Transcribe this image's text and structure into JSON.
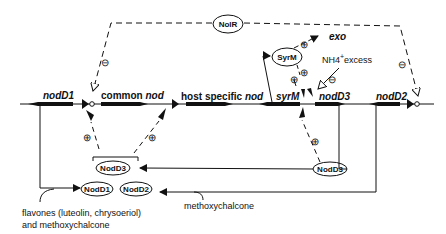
{
  "diagram": {
    "genes": {
      "nodD1": "nodD1",
      "common_prefix": "common ",
      "common_suffix": "nod",
      "host_prefix": "host specific ",
      "host_suffix": "nod",
      "syrM": "syrM",
      "nodD3": "nodD3",
      "nodD2": "nodD2",
      "exo": "exo"
    },
    "proteins": {
      "NolR": "NolR",
      "SyrM": "SyrM",
      "NodD3": "NodD3",
      "NodD1": "NodD1",
      "NodD2": "NodD2"
    },
    "signals": {
      "nh4_base": "NH4",
      "nh4_sup": "+",
      "nh4_suffix": "excess",
      "flavones_line1": "flavones (luteolin, chrysoeriol)",
      "flavones_line2": "and methoxychalcone",
      "methoxychalcone": "methoxychalcone"
    },
    "regulation_marks": {
      "positive": "⊕",
      "negative": "⊖"
    },
    "colors": {
      "ink": "#111111",
      "background": "#ffffff"
    }
  }
}
